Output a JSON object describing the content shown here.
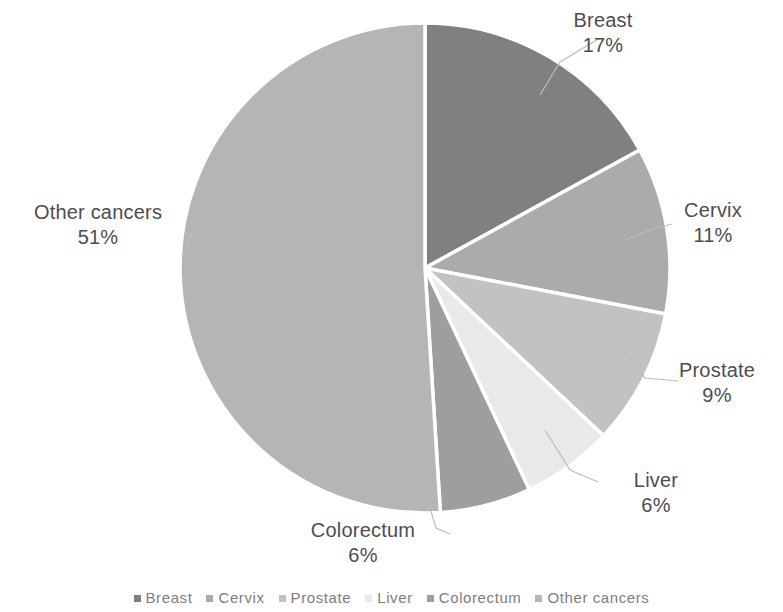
{
  "chart_data": {
    "type": "pie",
    "title": "",
    "categories": [
      "Breast",
      "Cervix",
      "Prostate",
      "Liver",
      "Colorectum",
      "Other cancers"
    ],
    "values": [
      17,
      11,
      9,
      6,
      6,
      51
    ],
    "value_suffix": "%",
    "legend_position": "bottom",
    "grid": false,
    "start_angle_deg": 0,
    "direction": "clockwise",
    "colors": [
      "#808080",
      "#ababab",
      "#c2c2c2",
      "#e9e9e9",
      "#9e9e9e",
      "#b5b5b5"
    ],
    "slice_border_color": "#ffffff",
    "labels": [
      {
        "name": "Breast",
        "value": "17%"
      },
      {
        "name": "Cervix",
        "value": "11%"
      },
      {
        "name": "Prostate",
        "value": "9%"
      },
      {
        "name": "Liver",
        "value": "6%"
      },
      {
        "name": "Colorectum",
        "value": "6%"
      },
      {
        "name": "Other cancers",
        "value": "51%"
      }
    ]
  },
  "legend": {
    "items": [
      {
        "label": "Breast",
        "color": "#808080"
      },
      {
        "label": "Cervix",
        "color": "#ababab"
      },
      {
        "label": "Prostate",
        "color": "#c2c2c2"
      },
      {
        "label": "Liver",
        "color": "#e9e9e9"
      },
      {
        "label": "Colorectum",
        "color": "#9e9e9e"
      },
      {
        "label": "Other cancers",
        "color": "#b5b5b5"
      }
    ]
  }
}
